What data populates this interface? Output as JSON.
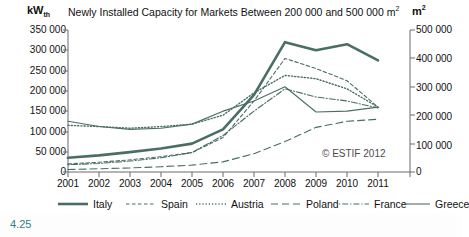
{
  "figure": {
    "number": "4.25",
    "credit": "© ESTIF 2012"
  },
  "header": {
    "title": "Newly Installed Capacity for Markets Between 200 000 and 500 000 m",
    "title_superscript": "2",
    "left_unit": "kW",
    "left_unit_subscript": "th",
    "right_unit": "m",
    "right_unit_superscript": "2"
  },
  "axes": {
    "left_ticks": [
      "350 000",
      "300 000",
      "250 000",
      "200 000",
      "150 000",
      "100 000",
      "50 000",
      "0"
    ],
    "right_ticks": [
      "500 000",
      "400 000",
      "300 000",
      "200 000",
      "100 000",
      "0"
    ],
    "x_ticks": [
      "2001",
      "2002",
      "2003",
      "2004",
      "2005",
      "2006",
      "2007",
      "2008",
      "2009",
      "2010",
      "2011"
    ]
  },
  "legend": {
    "items": [
      {
        "label": "Italy",
        "color": "#4a6e66",
        "style": "solid-thick"
      },
      {
        "label": "Spain",
        "color": "#4a6e66",
        "style": "dashed"
      },
      {
        "label": "Austria",
        "color": "#4a6e66",
        "style": "dotted"
      },
      {
        "label": "Poland",
        "color": "#4a6e66",
        "style": "longdash"
      },
      {
        "label": "France",
        "color": "#4a6e66",
        "style": "dashdot"
      },
      {
        "label": "Greece",
        "color": "#4a6e66",
        "style": "solid-thin"
      }
    ]
  },
  "chart_data": {
    "type": "line",
    "xlabel": "",
    "ylabel": "kW_th",
    "ylabel_right": "m²",
    "x": [
      2001,
      2002,
      2003,
      2004,
      2005,
      2006,
      2007,
      2008,
      2009,
      2010,
      2011
    ],
    "ylim": [
      0,
      350000
    ],
    "ylim_right": [
      0,
      500000
    ],
    "yticks": [
      0,
      50000,
      100000,
      150000,
      200000,
      250000,
      300000,
      350000
    ],
    "yticks_right": [
      0,
      100000,
      200000,
      300000,
      400000,
      500000
    ],
    "grid": false,
    "legend_position": "below",
    "series": [
      {
        "name": "Italy",
        "color": "#4a6e66",
        "style": "solid-thick",
        "values": [
          35000,
          41000,
          49000,
          58000,
          70000,
          105000,
          190000,
          320000,
          300000,
          315000,
          275000
        ]
      },
      {
        "name": "Spain",
        "color": "#4a6e66",
        "style": "dashed",
        "values": [
          20000,
          24000,
          30000,
          38000,
          48000,
          85000,
          175000,
          280000,
          255000,
          225000,
          160000
        ]
      },
      {
        "name": "Austria",
        "color": "#4a6e66",
        "style": "dotted",
        "values": [
          115000,
          112000,
          108000,
          112000,
          118000,
          140000,
          195000,
          238000,
          230000,
          205000,
          160000
        ]
      },
      {
        "name": "Poland",
        "color": "#4a6e66",
        "style": "longdash",
        "values": [
          6000,
          8000,
          10000,
          13000,
          17000,
          25000,
          45000,
          75000,
          110000,
          125000,
          130000
        ]
      },
      {
        "name": "France",
        "color": "#4a6e66",
        "style": "dashdot",
        "values": [
          18000,
          21000,
          27000,
          35000,
          48000,
          90000,
          150000,
          205000,
          185000,
          175000,
          158000
        ]
      },
      {
        "name": "Greece",
        "color": "#4a6e66",
        "style": "solid-thin",
        "values": [
          125000,
          112000,
          105000,
          108000,
          118000,
          150000,
          175000,
          210000,
          148000,
          150000,
          160000
        ]
      }
    ]
  }
}
